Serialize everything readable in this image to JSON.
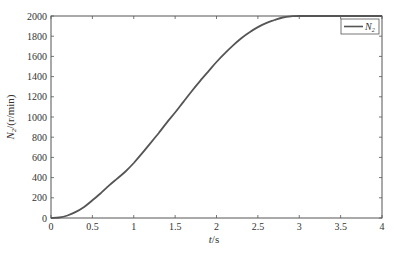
{
  "chart_data": {
    "type": "line",
    "title": "",
    "xlabel": "t/s",
    "ylabel": "N2/(r/min)",
    "xlim": [
      0,
      4
    ],
    "ylim": [
      0,
      2000
    ],
    "xticks": [
      0,
      0.5,
      1,
      1.5,
      2,
      2.5,
      3,
      3.5,
      4
    ],
    "xtick_labels": [
      "0",
      "0.5",
      "1",
      "1.5",
      "2",
      "2.5",
      "3",
      "3.5",
      "4"
    ],
    "yticks": [
      0,
      200,
      400,
      600,
      800,
      1000,
      1200,
      1400,
      1600,
      1800,
      2000
    ],
    "ytick_labels": [
      "0",
      "200",
      "400",
      "600",
      "800",
      "1000",
      "1200",
      "1400",
      "1600",
      "1800",
      "2000"
    ],
    "grid": false,
    "legend_position": "upper right",
    "series": [
      {
        "name": "N2",
        "color": "#555555",
        "x": [
          0,
          0.1,
          0.2,
          0.3,
          0.4,
          0.5,
          0.6,
          0.7,
          0.8,
          0.9,
          1.0,
          1.1,
          1.2,
          1.3,
          1.4,
          1.5,
          1.6,
          1.7,
          1.8,
          1.9,
          2.0,
          2.1,
          2.2,
          2.3,
          2.4,
          2.5,
          2.6,
          2.7,
          2.8,
          2.9,
          3.0,
          3.5,
          4.0
        ],
        "y": [
          0,
          5,
          25,
          60,
          110,
          175,
          245,
          320,
          390,
          460,
          545,
          640,
          740,
          840,
          945,
          1045,
          1150,
          1255,
          1355,
          1450,
          1545,
          1630,
          1710,
          1780,
          1840,
          1890,
          1930,
          1960,
          1985,
          1997,
          2000,
          2000,
          2000
        ]
      }
    ]
  },
  "labels": {
    "xlabel_italic": "t",
    "xlabel_rest": "/s",
    "ylabel_var": "N",
    "ylabel_sub": "2",
    "ylabel_rest": "/(r/min)",
    "legend_var": "N",
    "legend_sub": "2"
  }
}
